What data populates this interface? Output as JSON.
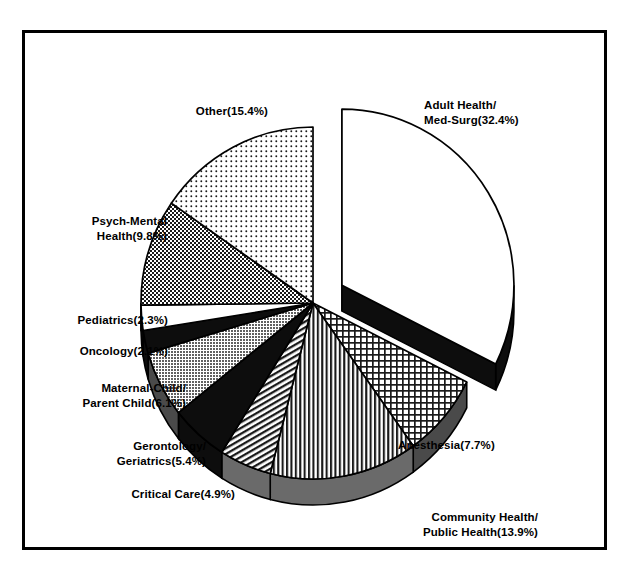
{
  "chart_data": {
    "type": "pie",
    "title": "",
    "subtitle": "",
    "xlabel": "",
    "ylabel": "",
    "legend_position": "labels-outside",
    "grid": false,
    "exploded_slice": "Adult Health/Med-Surg",
    "start_angle_deg": 0,
    "direction": "clockwise",
    "categories": [
      "Adult Health/Med-Surg",
      "Anesthesia",
      "Community Health/Public Health",
      "Critical Care",
      "Gerontology/Geriatrics",
      "Maternal-Child/Parent Child",
      "Oncology",
      "Pediatrics",
      "Psych-Mental Health",
      "Other"
    ],
    "values": [
      32.4,
      7.7,
      13.9,
      4.9,
      5.4,
      6.1,
      2.1,
      2.3,
      9.8,
      15.4
    ],
    "units": "percent",
    "total": 100.0,
    "slices": [
      {
        "name": "Adult Health/Med-Surg",
        "value": 32.4,
        "label": "Adult Health/\nMed-Surg(32.4%)",
        "fill": "white",
        "exploded": true
      },
      {
        "name": "Anesthesia",
        "value": 7.7,
        "label": "Anesthesia(7.7%)",
        "fill": "crosshatch-grid",
        "exploded": false
      },
      {
        "name": "Community Health/Public Health",
        "value": 13.9,
        "label": "Community Health/\nPublic Health(13.9%)",
        "fill": "vertical-stripes",
        "exploded": false
      },
      {
        "name": "Critical Care",
        "value": 4.9,
        "label": "Critical Care(4.9%)",
        "fill": "diagonal-hatch",
        "exploded": false
      },
      {
        "name": "Gerontology/Geriatrics",
        "value": 5.4,
        "label": "Gerontology/\nGeriatrics(5.4%)",
        "fill": "solid-black",
        "exploded": false
      },
      {
        "name": "Maternal-Child/Parent Child",
        "value": 6.1,
        "label": "Maternal-Child/\nParent Child(6.1%)",
        "fill": "gray-stipple",
        "exploded": false
      },
      {
        "name": "Oncology",
        "value": 2.1,
        "label": "Oncology(2.1%)",
        "fill": "solid-black",
        "exploded": false
      },
      {
        "name": "Pediatrics",
        "value": 2.3,
        "label": "Pediatrics(2.3%)",
        "fill": "white",
        "exploded": false
      },
      {
        "name": "Psych-Mental Health",
        "value": 9.8,
        "label": "Psych-Mental\nHealth(9.8%)",
        "fill": "dense-checker",
        "exploded": false
      },
      {
        "name": "Other",
        "value": 15.4,
        "label": "Other(15.4%)",
        "fill": "light-dots",
        "exploded": false
      }
    ],
    "colors": {
      "outline": "#000000",
      "background": "#ffffff",
      "side_wall_gray": "#9a9a9a",
      "side_wall_dark": "#111111"
    }
  }
}
